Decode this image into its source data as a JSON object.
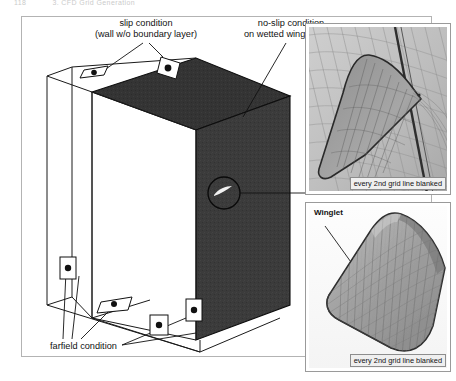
{
  "page": {
    "running_head_number": "118",
    "running_head_title": "3.  CFD Grid Generation"
  },
  "figure": {
    "labels": {
      "slip_line1": "slip condition",
      "slip_line2": "(wall w/o boundary layer)",
      "noslip_line1": "no-slip condition",
      "noslip_line2": "on wetted wing surface",
      "farfield": "farfield condition"
    },
    "insets": {
      "top": {
        "caption": "every 2nd grid line blanked"
      },
      "bottom": {
        "label": "Winglet",
        "caption": "every 2nd grid line blanked"
      }
    },
    "colors": {
      "box_front_face": "#3a3a3a",
      "box_top_face": "#333333",
      "box_outline": "#111111",
      "frame_border": "#b3b3b3",
      "caption_bg": "#efefef",
      "page_bg": "#ffffff"
    }
  }
}
